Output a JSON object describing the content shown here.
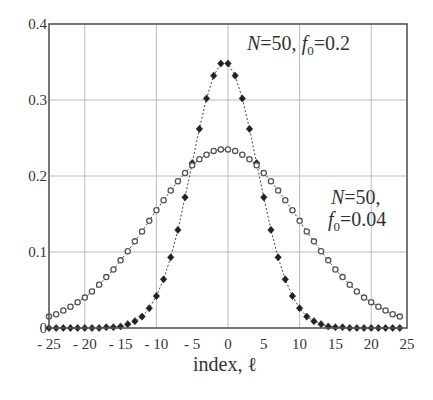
{
  "chart_data": {
    "type": "scatter",
    "title": "",
    "xlabel": "index, ℓ",
    "ylabel": "",
    "xlim": [
      -25,
      25
    ],
    "ylim": [
      0,
      0.4
    ],
    "grid": true,
    "x_ticks": [
      -25,
      -20,
      -15,
      -10,
      -5,
      0,
      5,
      10,
      15,
      20,
      25
    ],
    "x_tick_labels": [
      "- 25",
      "- 20",
      "- 15",
      "- 10",
      "- 5",
      "0",
      "5",
      "10",
      "15",
      "20",
      "25"
    ],
    "y_ticks": [
      0,
      0.1,
      0.2,
      0.3,
      0.4
    ],
    "y_tick_labels": [
      "0",
      "0.1",
      "0.2",
      "0.3",
      "0.4"
    ],
    "x": [
      -25,
      -24,
      -23,
      -22,
      -21,
      -20,
      -19,
      -18,
      -17,
      -16,
      -15,
      -14,
      -13,
      -12,
      -11,
      -10,
      -9,
      -8,
      -7,
      -6,
      -5,
      -4,
      -3,
      -2,
      -1,
      0,
      1,
      2,
      3,
      4,
      5,
      6,
      7,
      8,
      9,
      10,
      11,
      12,
      13,
      14,
      15,
      16,
      17,
      18,
      19,
      20,
      21,
      22,
      23,
      24
    ],
    "series": [
      {
        "name": "N=50, f0=0.2",
        "marker": "filled-diamond",
        "line": "dashed",
        "values": [
          0.0,
          0.0,
          0.0,
          0.0,
          0.0,
          0.0,
          0.0,
          0.0,
          0.001,
          0.001,
          0.002,
          0.005,
          0.009,
          0.015,
          0.026,
          0.042,
          0.064,
          0.093,
          0.129,
          0.172,
          0.217,
          0.262,
          0.302,
          0.332,
          0.348,
          0.348,
          0.332,
          0.302,
          0.262,
          0.217,
          0.172,
          0.129,
          0.093,
          0.064,
          0.042,
          0.026,
          0.015,
          0.009,
          0.005,
          0.002,
          0.001,
          0.001,
          0.0,
          0.0,
          0.0,
          0.0,
          0.0,
          0.0,
          0.0,
          0.0
        ]
      },
      {
        "name": "N=50, f0=0.04",
        "marker": "open-circle",
        "line": "dashed",
        "values": [
          0.015,
          0.018,
          0.023,
          0.028,
          0.034,
          0.04,
          0.048,
          0.057,
          0.067,
          0.077,
          0.089,
          0.101,
          0.114,
          0.127,
          0.141,
          0.155,
          0.168,
          0.181,
          0.193,
          0.204,
          0.214,
          0.222,
          0.228,
          0.233,
          0.235,
          0.235,
          0.233,
          0.228,
          0.222,
          0.214,
          0.204,
          0.193,
          0.181,
          0.168,
          0.155,
          0.141,
          0.127,
          0.114,
          0.101,
          0.089,
          0.077,
          0.067,
          0.057,
          0.048,
          0.04,
          0.034,
          0.028,
          0.023,
          0.018,
          0.015
        ]
      }
    ],
    "annotations": [
      {
        "id": "top",
        "N": "N",
        "eq1": "=50, ",
        "f": "f",
        "sub": "0",
        "eq2": "=0.2"
      },
      {
        "id": "bottom",
        "line1_N": "N",
        "line1_rest": "=50,",
        "line2_f": "f",
        "line2_sub": "0",
        "line2_rest": "=0.04"
      }
    ]
  }
}
